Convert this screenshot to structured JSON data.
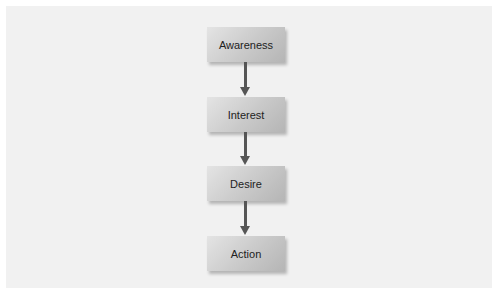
{
  "diagram": {
    "type": "flowchart",
    "direction": "top-to-bottom",
    "nodes": [
      {
        "id": "awareness",
        "label": "Awareness"
      },
      {
        "id": "interest",
        "label": "Interest"
      },
      {
        "id": "desire",
        "label": "Desire"
      },
      {
        "id": "action",
        "label": "Action"
      }
    ],
    "edges": [
      {
        "from": "awareness",
        "to": "interest"
      },
      {
        "from": "interest",
        "to": "desire"
      },
      {
        "from": "desire",
        "to": "action"
      }
    ],
    "colors": {
      "box": "#c9c9c9",
      "arrow": "#555555",
      "background": "#f1f1f1"
    }
  }
}
